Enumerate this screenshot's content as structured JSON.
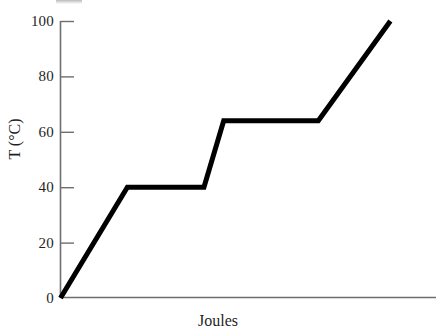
{
  "chart_data": {
    "type": "line",
    "title": "",
    "xlabel": "Joules",
    "ylabel": "T (°C)",
    "ylim": [
      0,
      100
    ],
    "xlim": [
      0,
      100
    ],
    "grid": false,
    "legend": "none",
    "y_ticks": [
      0,
      20,
      40,
      60,
      80,
      100
    ],
    "y_tick_labels": [
      "0",
      "20",
      "40",
      "60",
      "80",
      "100"
    ],
    "x_ticks": [],
    "x_tick_labels": [],
    "series": [
      {
        "name": "heating curve",
        "color": "#000000",
        "line_width": 5,
        "x": [
          0,
          19.3,
          41.4,
          47.1,
          74.4,
          95.2
        ],
        "y": [
          0,
          40,
          40,
          64,
          64,
          100
        ],
        "points": [
          {
            "x": 0,
            "y": 0,
            "note": "origin, start of solid heating"
          },
          {
            "x": 19.3,
            "y": 40,
            "note": "start of first plateau (melting)"
          },
          {
            "x": 41.4,
            "y": 40,
            "note": "end of first plateau"
          },
          {
            "x": 47.1,
            "y": 64,
            "note": "start of second plateau (boiling)"
          },
          {
            "x": 74.4,
            "y": 64,
            "note": "end of second plateau"
          },
          {
            "x": 95.2,
            "y": 100,
            "note": "end of curve"
          }
        ]
      }
    ]
  },
  "axes": {
    "y_axis_name": "temperature-axis",
    "x_axis_name": "energy-axis",
    "tick_labels": [
      "100",
      "80",
      "60",
      "40",
      "20",
      "0"
    ]
  },
  "labels": {
    "y_axis_title": "T (°C)",
    "x_axis_title": "Joules"
  },
  "colors": {
    "line": "#000000",
    "axis": "#6e6e6e",
    "text": "#1f1f1f",
    "background": "#ffffff"
  }
}
